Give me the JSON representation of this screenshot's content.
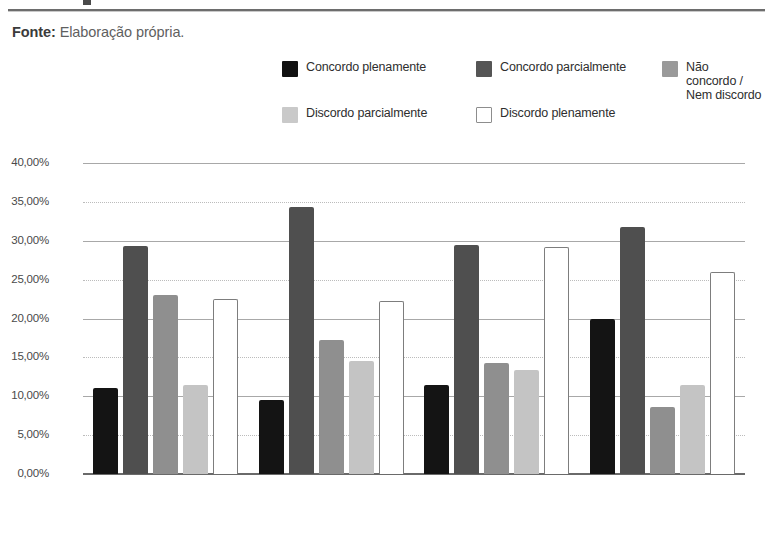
{
  "header": {
    "rule_present": true
  },
  "source": {
    "label": "Fonte:",
    "text": " Elaboração própria."
  },
  "legend": {
    "items": [
      {
        "label": "Concordo plenamente",
        "swatch": "black",
        "color": "#141414"
      },
      {
        "label": "Concordo parcialmente",
        "swatch": "dark",
        "color": "#4f4f4f"
      },
      {
        "label": "Não concordo /\nNem discordo",
        "swatch": "mid",
        "color": "#8f8f8f"
      },
      {
        "label": "Discordo parcialmente",
        "swatch": "light",
        "color": "#c4c4c4"
      },
      {
        "label": "Discordo plenamente",
        "swatch": "white",
        "color": "#ffffff"
      }
    ]
  },
  "axis": {
    "y_ticks": [
      "40,00%",
      "35,00%",
      "30,00%",
      "25,00%",
      "20,00%",
      "15,00%",
      "10,00%",
      "5,00%",
      "0,00%"
    ]
  },
  "chart_data": {
    "type": "bar",
    "title": "",
    "xlabel": "",
    "ylabel": "",
    "ylim": [
      0,
      40
    ],
    "ytick_values": [
      40,
      35,
      30,
      25,
      20,
      15,
      10,
      5,
      0
    ],
    "ytick_labels": [
      "40,00%",
      "35,00%",
      "30,00%",
      "25,00%",
      "20,00%",
      "15,00%",
      "10,00%",
      "5,00%",
      "0,00%"
    ],
    "grid": true,
    "legend_position": "top",
    "categories": [
      "Classe E:\n0 a 2 S. M.",
      "Classe D:\n2 a 4 S. M.",
      "Classe C:\n4 a 10 S. M.",
      "Classes A e B:\nacima de 10 S. M."
    ],
    "series": [
      {
        "name": "Concordo plenamente",
        "color": "#141414",
        "values": [
          11.0,
          9.5,
          11.5,
          20.0
        ]
      },
      {
        "name": "Concordo parcialmente",
        "color": "#4f4f4f",
        "values": [
          29.3,
          34.3,
          29.4,
          31.8
        ]
      },
      {
        "name": "Não concordo / Nem discordo",
        "color": "#8f8f8f",
        "values": [
          23.0,
          17.2,
          14.3,
          8.6
        ]
      },
      {
        "name": "Discordo parcialmente",
        "color": "#c4c4c4",
        "values": [
          11.5,
          14.5,
          13.4,
          11.5
        ]
      },
      {
        "name": "Discordo plenamente",
        "color": "#ffffff",
        "values": [
          22.5,
          22.2,
          29.2,
          26.0
        ]
      }
    ]
  }
}
